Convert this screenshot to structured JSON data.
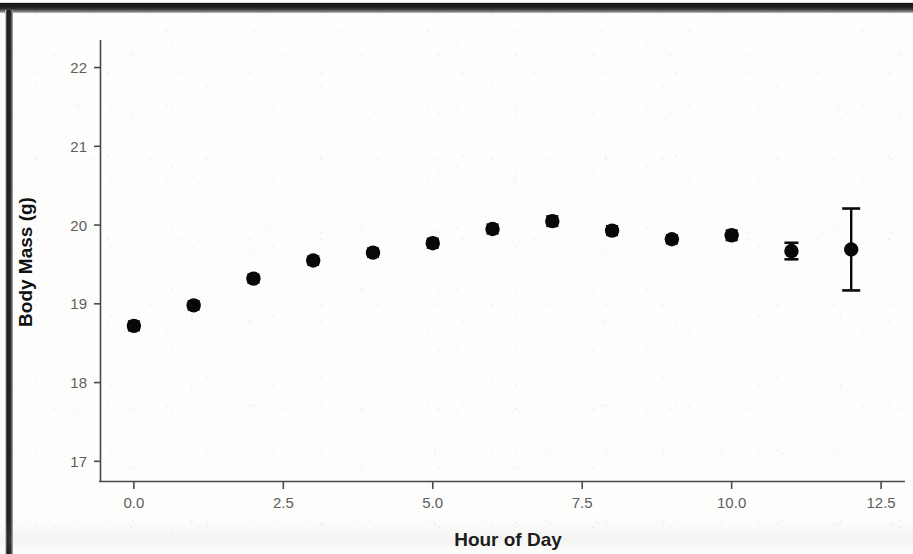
{
  "chart_data": {
    "type": "scatter",
    "title": "",
    "subtitle": "",
    "xlabel": "Hour of Day",
    "ylabel": "Body Mass (g)",
    "xlim": [
      -0.55,
      12.9
    ],
    "ylim": [
      16.75,
      22.35
    ],
    "xticks": [
      0.0,
      2.5,
      5.0,
      7.5,
      10.0,
      12.5
    ],
    "xtick_labels": [
      "0.0",
      "2.5",
      "5.0",
      "7.5",
      "10.0",
      "12.5"
    ],
    "yticks": [
      17,
      18,
      19,
      20,
      21,
      22
    ],
    "ytick_labels": [
      "17",
      "18",
      "19",
      "20",
      "21",
      "22"
    ],
    "grid": false,
    "legend": false,
    "legend_position": "none",
    "point_color": "#080808",
    "errorbar_color": "#0a0a0a",
    "axis_color": "#4a4a4a",
    "x": [
      0,
      1,
      2,
      3,
      4,
      5,
      6,
      7,
      8,
      9,
      10,
      11,
      12
    ],
    "y": [
      18.72,
      18.98,
      19.32,
      19.55,
      19.65,
      19.77,
      19.95,
      20.05,
      19.93,
      19.82,
      19.87,
      19.67,
      19.69
    ],
    "yerr": [
      0.055,
      0.05,
      0.05,
      0.05,
      0.05,
      0.055,
      0.055,
      0.06,
      0.055,
      0.05,
      0.06,
      0.105,
      0.52
    ],
    "series": [
      {
        "name": "Body Mass",
        "x": [
          0,
          1,
          2,
          3,
          4,
          5,
          6,
          7,
          8,
          9,
          10,
          11,
          12
        ],
        "values": [
          18.72,
          18.98,
          19.32,
          19.55,
          19.65,
          19.77,
          19.95,
          20.05,
          19.93,
          19.82,
          19.87,
          19.67,
          19.69
        ],
        "errors": [
          0.055,
          0.05,
          0.05,
          0.05,
          0.05,
          0.055,
          0.055,
          0.06,
          0.055,
          0.05,
          0.06,
          0.105,
          0.52
        ]
      }
    ]
  }
}
